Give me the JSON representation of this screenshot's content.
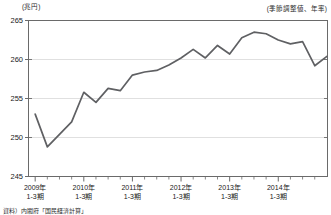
{
  "header": {
    "unit_label": "(兆円)",
    "note_label": "(季節調整値、年率)"
  },
  "footer": {
    "source_label": "資料）内閣府「国民経済計算」"
  },
  "axis": {
    "y_ticks": [
      "265",
      "260",
      "255",
      "250",
      "245"
    ],
    "x_groups": [
      {
        "year": "2009年",
        "quarter": "1-3期"
      },
      {
        "year": "2010年",
        "quarter": "1-3期"
      },
      {
        "year": "2011年",
        "quarter": "1-3期"
      },
      {
        "year": "2012年",
        "quarter": "1-3期"
      },
      {
        "year": "2013年",
        "quarter": "1-3期"
      },
      {
        "year": "2014年",
        "quarter": "1-3期"
      }
    ]
  },
  "style": {
    "line_color": "#5f6063",
    "axis_color": "#6a6a6a",
    "grid_color": "#d8d8d8",
    "background": "#ffffff"
  },
  "chart_data": {
    "type": "line",
    "title": "",
    "subtitle": "",
    "xlabel": "",
    "ylabel": "(兆円)",
    "annotation": "(季節調整値、年率)",
    "ylim": [
      245,
      265
    ],
    "yticks": [
      245,
      250,
      255,
      260,
      265
    ],
    "grid": true,
    "legend": "none",
    "x": [
      "2009 1-3期",
      "2009 4-6期",
      "2009 7-9期",
      "2009 10-12期",
      "2010 1-3期",
      "2010 4-6期",
      "2010 7-9期",
      "2010 10-12期",
      "2011 1-3期",
      "2011 4-6期",
      "2011 7-9期",
      "2011 10-12期",
      "2012 1-3期",
      "2012 4-6期",
      "2012 7-9期",
      "2012 10-12期",
      "2013 1-3期",
      "2013 4-6期",
      "2013 7-9期",
      "2013 10-12期",
      "2014 1-3期",
      "2014 4-6期",
      "2014 7-9期",
      "2014 10-12期"
    ],
    "values": [
      253.0,
      248.8,
      250.4,
      252.0,
      255.8,
      254.5,
      256.3,
      256.0,
      258.0,
      258.4,
      258.6,
      259.3,
      260.2,
      261.3,
      260.2,
      261.8,
      260.7,
      262.8,
      263.5,
      263.3,
      262.5,
      262.0,
      262.3,
      259.2
    ],
    "tail_value": 260.4
  }
}
